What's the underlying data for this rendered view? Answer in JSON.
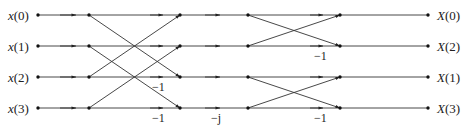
{
  "diagram": {
    "type": "signal-flow-graph",
    "inputs": [
      {
        "var": "x",
        "index": "(0)",
        "label": "x(0)"
      },
      {
        "var": "x",
        "index": "(1)",
        "label": "x(1)"
      },
      {
        "var": "x",
        "index": "(2)",
        "label": "x(2)"
      },
      {
        "var": "x",
        "index": "(3)",
        "label": "x(3)"
      }
    ],
    "outputs": [
      {
        "var": "X",
        "index": "(0)",
        "label": "X(0)"
      },
      {
        "var": "X",
        "index": "(2)",
        "label": "X(2)"
      },
      {
        "var": "X",
        "index": "(1)",
        "label": "X(1)"
      },
      {
        "var": "X",
        "index": "(3)",
        "label": "X(3)"
      }
    ],
    "weights": [
      {
        "text": "−1",
        "stage": 1,
        "row": 2
      },
      {
        "text": "−1",
        "stage": 1,
        "row": 3
      },
      {
        "text": "−j",
        "stage": "twiddle",
        "row": 3
      },
      {
        "text": "−1",
        "stage": 2,
        "row": 1
      },
      {
        "text": "−1",
        "stage": 2,
        "row": 3
      }
    ],
    "colors": {
      "line": "#333333",
      "node": "#111111",
      "text": "#222222"
    }
  }
}
